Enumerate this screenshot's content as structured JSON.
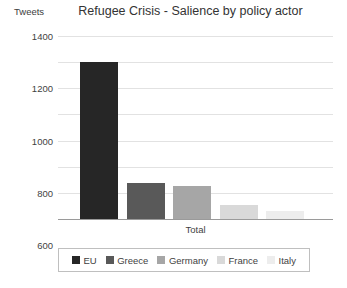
{
  "chart_data": {
    "type": "bar",
    "title": "Refugee Crisis - Salience by policy actor",
    "xlabel": "Total",
    "ylabel": "Tweets",
    "categories": [
      "Total"
    ],
    "grid": true,
    "legend_position": "bottom",
    "ylim": [
      0,
      1400
    ],
    "yticks": [
      1400,
      1200,
      1000,
      800,
      600,
      400,
      200,
      0
    ],
    "series": [
      {
        "name": "EU",
        "values": [
          1200
        ],
        "color": "#262626"
      },
      {
        "name": "Greece",
        "values": [
          275
        ],
        "color": "#595959"
      },
      {
        "name": "Germany",
        "values": [
          250
        ],
        "color": "#a6a6a6"
      },
      {
        "name": "France",
        "values": [
          110
        ],
        "color": "#d9d9d9"
      },
      {
        "name": "Italy",
        "values": [
          65
        ],
        "color": "#ededed"
      }
    ]
  }
}
